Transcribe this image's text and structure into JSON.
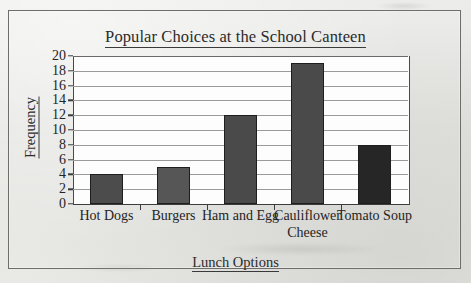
{
  "chart_data": {
    "type": "bar",
    "title": "Popular Choices at the School Canteen",
    "xlabel": "Lunch Options",
    "ylabel": "Frequency",
    "categories": [
      "Hot Dogs",
      "Burgers",
      "Ham and Egg",
      "Cauliflower Cheese",
      "Tomato Soup"
    ],
    "values": [
      4,
      5,
      12,
      19,
      8
    ],
    "ylim": [
      0,
      20
    ],
    "ytick_step": 2,
    "yticks": [
      0,
      2,
      4,
      6,
      8,
      10,
      12,
      14,
      16,
      18,
      20
    ],
    "grid": "horizontal",
    "legend": "none",
    "bar_colors": [
      "#4c4c4c",
      "#565656",
      "#4a4a4a",
      "#4a4a4a",
      "#262626"
    ],
    "bar_border_color": "#1e1e1e"
  },
  "style": {
    "paper_color": "#e6e6e3",
    "frame_color": "#6d6d6b",
    "plot_bg": "#fdfdfd",
    "axis_color": "#3c3c3c",
    "gridline_color": "#9a9a9a",
    "text_color": "#242424"
  }
}
